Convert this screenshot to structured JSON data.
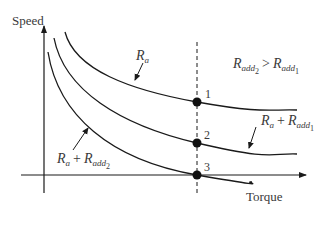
{
  "axes": {
    "y_label": "Speed",
    "x_label": "Torque"
  },
  "curves": [
    {
      "id": "ra",
      "label_main": "R",
      "label_sub": "a",
      "description": "R_a"
    },
    {
      "id": "ra_radd1",
      "label_main": "R",
      "label_sub": "a",
      "plus": "+",
      "label2_main": "R",
      "label2_sub": "add",
      "label2_subsub": "1",
      "description": "R_a + R_add1"
    },
    {
      "id": "ra_radd2",
      "label_main": "R",
      "label_sub": "a",
      "plus": "+",
      "label2_main": "R",
      "label2_sub": "add",
      "label2_subsub": "2",
      "description": "R_a + R_add2"
    }
  ],
  "points": [
    {
      "label": "1"
    },
    {
      "label": "2"
    },
    {
      "label": "3"
    }
  ],
  "relation": {
    "left_main": "R",
    "left_sub": "add",
    "left_subsub": "2",
    "operator": ">",
    "right_main": "R",
    "right_sub": "add",
    "right_subsub": "1",
    "description": "R_add2 > R_add1"
  },
  "colors": {
    "line": "#1a1a1a",
    "text": "#3a3a3a"
  }
}
